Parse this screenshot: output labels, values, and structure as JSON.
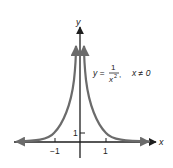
{
  "figure": {
    "equation": {
      "lhs": "y =",
      "numerator": "1",
      "denominator": "x",
      "exponent": "2",
      "comma": ",",
      "condition": "x ≠ 0"
    },
    "axes": {
      "x_label": "x",
      "y_label": "y",
      "x_ticks": [
        "−1",
        "1"
      ],
      "y_ticks": [
        "1"
      ]
    },
    "colors": {
      "curve": "#6b6b6b",
      "axes": "#1e1e1e",
      "background": "#ffffff"
    }
  }
}
